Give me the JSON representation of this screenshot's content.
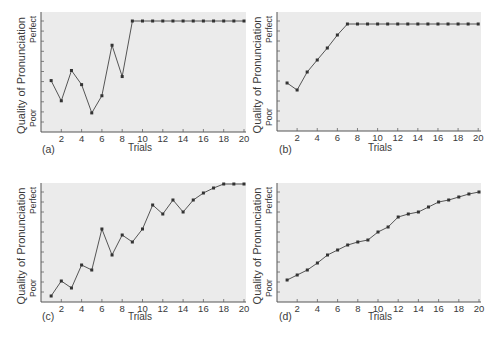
{
  "figure": {
    "panels_layout": "2x2",
    "plot_background": "#ebebeb",
    "page_background": "#ffffff",
    "line_color": "#555555",
    "marker_color": "#333333"
  },
  "chart_data": [
    {
      "type": "line",
      "panel_label": "(a)",
      "xlabel": "Trials",
      "ylabel": "Quality of Pronunciation",
      "y_top_label": "Perfect",
      "y_bottom_label": "Poor",
      "x_ticks": [
        2,
        4,
        6,
        8,
        10,
        12,
        14,
        16,
        18,
        20
      ],
      "xlim": [
        0,
        20
      ],
      "ylim": [
        0,
        10
      ],
      "y_tick_count": 11,
      "grid": false,
      "legend": null,
      "x": [
        1,
        2,
        3,
        4,
        5,
        6,
        7,
        8,
        9,
        10,
        11,
        12,
        13,
        14,
        15,
        16,
        17,
        18,
        19,
        20
      ],
      "values": [
        4.1,
        2.1,
        5.1,
        3.7,
        0.9,
        2.6,
        7.6,
        4.5,
        10,
        10,
        10,
        10,
        10,
        10,
        10,
        10,
        10,
        10,
        10,
        10
      ]
    },
    {
      "type": "line",
      "panel_label": "(b)",
      "xlabel": "Trials",
      "ylabel": "Quality of Pronunciation",
      "y_top_label": "Perfect",
      "y_bottom_label": "Poor",
      "x_ticks": [
        2,
        4,
        6,
        8,
        10,
        12,
        14,
        16,
        18,
        20
      ],
      "xlim": [
        0,
        20
      ],
      "ylim": [
        0,
        10
      ],
      "y_tick_count": 11,
      "grid": false,
      "legend": null,
      "x": [
        1,
        2,
        3,
        4,
        5,
        6,
        7,
        8,
        9,
        10,
        11,
        12,
        13,
        14,
        15,
        16,
        17,
        18,
        19,
        20
      ],
      "values": [
        3.8,
        3.1,
        4.9,
        6.1,
        7.3,
        8.6,
        9.7,
        9.7,
        9.7,
        9.7,
        9.7,
        9.7,
        9.7,
        9.7,
        9.7,
        9.7,
        9.7,
        9.7,
        9.7,
        9.7
      ]
    },
    {
      "type": "line",
      "panel_label": "(c)",
      "xlabel": "Trials",
      "ylabel": "Quality of Pronunciation",
      "y_top_label": "Perfect",
      "y_bottom_label": "Poor",
      "x_ticks": [
        2,
        4,
        6,
        8,
        10,
        12,
        14,
        16,
        18,
        20
      ],
      "xlim": [
        0,
        20
      ],
      "ylim": [
        0,
        10
      ],
      "y_tick_count": 11,
      "grid": false,
      "legend": null,
      "x": [
        1,
        2,
        3,
        4,
        5,
        6,
        7,
        8,
        9,
        10,
        11,
        12,
        13,
        14,
        15,
        16,
        17,
        18,
        19,
        20
      ],
      "values": [
        -0.4,
        1.1,
        0.4,
        2.7,
        2.2,
        6.3,
        3.7,
        5.7,
        5.0,
        6.3,
        8.7,
        7.8,
        9.2,
        8.0,
        9.2,
        9.9,
        10.4,
        10.8,
        10.8,
        10.8
      ]
    },
    {
      "type": "line",
      "panel_label": "(d)",
      "xlabel": "Trials",
      "ylabel": "Quality of Pronunciation",
      "y_top_label": "Perfect",
      "y_bottom_label": "Poor",
      "x_ticks": [
        2,
        4,
        6,
        8,
        10,
        12,
        14,
        16,
        18,
        20
      ],
      "xlim": [
        0,
        20
      ],
      "ylim": [
        0,
        10
      ],
      "y_tick_count": 11,
      "grid": false,
      "legend": null,
      "x": [
        1,
        2,
        3,
        4,
        5,
        6,
        7,
        8,
        9,
        10,
        11,
        12,
        13,
        14,
        15,
        16,
        17,
        18,
        19,
        20
      ],
      "values": [
        1.2,
        1.7,
        2.2,
        2.9,
        3.7,
        4.2,
        4.7,
        5.0,
        5.2,
        6.0,
        6.5,
        7.5,
        7.8,
        8.0,
        8.5,
        9.0,
        9.2,
        9.5,
        9.8,
        10.0
      ]
    }
  ]
}
